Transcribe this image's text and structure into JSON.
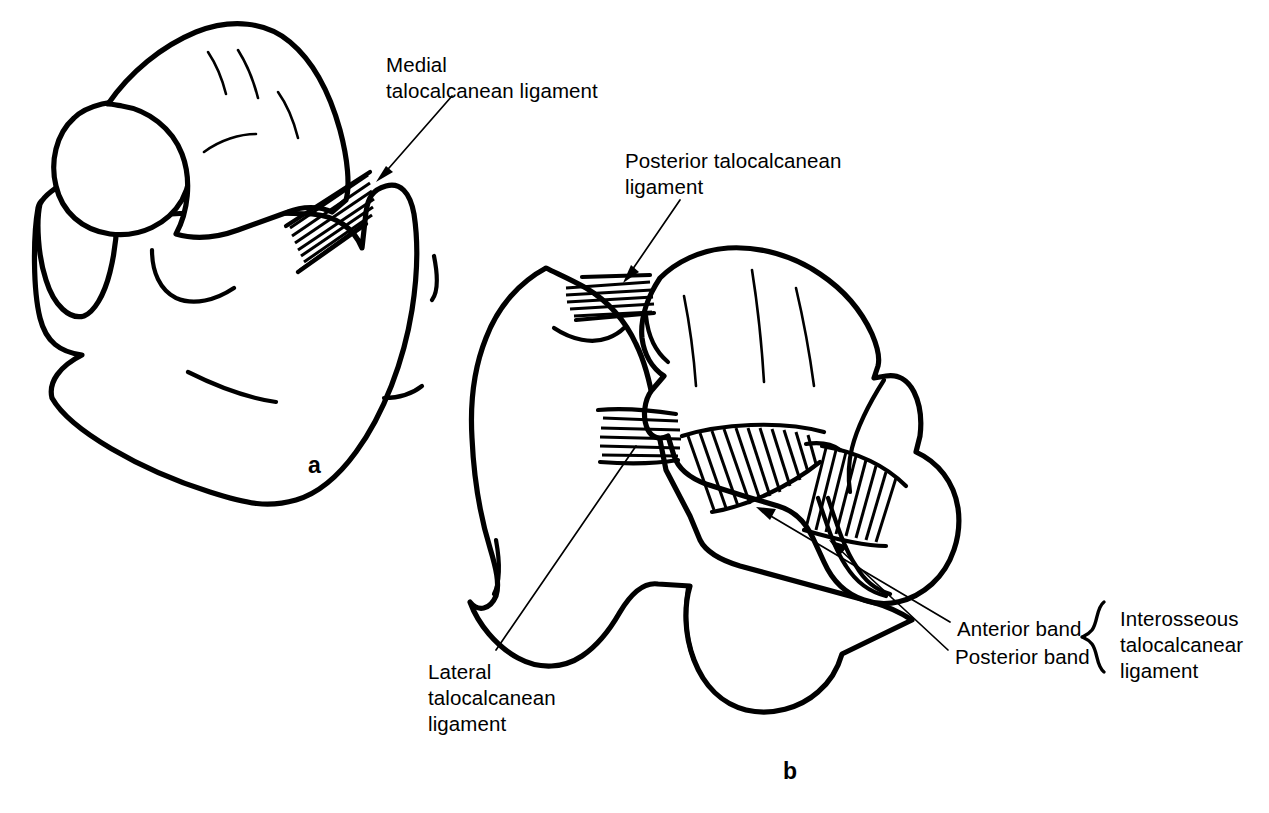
{
  "figure": {
    "background_color": "#ffffff",
    "ink_color": "#000000",
    "width": 1269,
    "height": 813
  },
  "panels": [
    {
      "letter": "a",
      "x": 308,
      "y": 452,
      "description": "Medial view of talus and calcaneus"
    },
    {
      "letter": "b",
      "x": 783,
      "y": 758,
      "description": "Superior view of calcaneus with talus displaced, showing interosseous ligament"
    }
  ],
  "labels": [
    {
      "id": "medial-talocalcanean-ligament",
      "lines": [
        "Medial",
        "talocalcanean ligament"
      ],
      "x": 386,
      "y": 52,
      "align": "left"
    },
    {
      "id": "posterior-talocalcanean-ligament",
      "lines": [
        "Posterior talocalcanean",
        "ligament"
      ],
      "x": 625,
      "y": 148,
      "align": "left"
    },
    {
      "id": "lateral-talocalcanean-ligament",
      "lines": [
        "Lateral",
        "talocalcanean",
        "ligament"
      ],
      "x": 428,
      "y": 659,
      "align": "left"
    },
    {
      "id": "anterior-band",
      "lines": [
        "Anterior band"
      ],
      "x": 957,
      "y": 616,
      "align": "left"
    },
    {
      "id": "posterior-band",
      "lines": [
        "Posterior band"
      ],
      "x": 955,
      "y": 644,
      "align": "left"
    },
    {
      "id": "interosseous-talocalcanear-ligament",
      "lines": [
        "Interosseous",
        "talocalcanear",
        "ligament"
      ],
      "x": 1120,
      "y": 606,
      "align": "left"
    }
  ],
  "structures": [
    {
      "id": "talus-a",
      "panel": "a",
      "name": "Talus"
    },
    {
      "id": "calcaneus-a",
      "panel": "a",
      "name": "Calcaneus"
    },
    {
      "id": "medial-ligament-fibers-a",
      "panel": "a",
      "name": "Medial talocalcanean ligament fibers"
    },
    {
      "id": "calcaneus-b",
      "panel": "b",
      "name": "Calcaneus"
    },
    {
      "id": "talus-b",
      "panel": "b",
      "name": "Talus"
    },
    {
      "id": "posterior-ligament-fibers-b",
      "panel": "b",
      "name": "Posterior talocalcanean ligament fibers"
    },
    {
      "id": "lateral-ligament-fibers-b",
      "panel": "b",
      "name": "Lateral talocalcanean ligament fibers"
    },
    {
      "id": "interosseous-anterior-band-b",
      "panel": "b",
      "name": "Interosseous ligament anterior band"
    },
    {
      "id": "interosseous-posterior-band-b",
      "panel": "b",
      "name": "Interosseous ligament posterior band"
    }
  ]
}
